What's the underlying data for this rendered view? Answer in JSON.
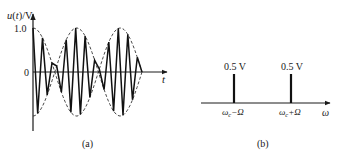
{
  "chart_data": [
    {
      "type": "line",
      "panel": "(a)",
      "title": "",
      "xlabel": "t",
      "ylabel": "u(t)/V",
      "y_ticks": [
        "1.0",
        "0"
      ],
      "ylim": [
        -1.0,
        1.0
      ],
      "series": [
        {
          "name": "DSB signal u(t)",
          "style": "solid",
          "description": "carrier oscillating inside envelope, phase reverses at envelope zeros"
        },
        {
          "name": "envelope ±cos(Ωt)",
          "style": "dashed",
          "peaks": [
            1.0,
            -1.0
          ]
        }
      ],
      "caption": "(a)"
    },
    {
      "type": "bar",
      "panel": "(b)",
      "title": "",
      "xlabel": "ω",
      "categories": [
        "ωc−Ω",
        "ωc+Ω"
      ],
      "values": [
        0.5,
        0.5
      ],
      "value_labels": [
        "0.5 V",
        "0.5 V"
      ],
      "unit": "V",
      "caption": "(b)"
    }
  ],
  "labels": {
    "a": {
      "ylabel_u": "u",
      "ylabel_paren_open": "(",
      "ylabel_t": "t",
      "ylabel_rest": ")/V",
      "tick_one": "1.0",
      "tick_zero": "0",
      "xlabel": "t",
      "caption": "(a)"
    },
    "b": {
      "line1_value": "0.5 V",
      "line2_value": "0.5 V",
      "line1_freq_omega": "ω",
      "line1_freq_sub": "c",
      "line1_freq_rest": "−Ω",
      "line2_freq_omega": "ω",
      "line2_freq_sub": "c",
      "line2_freq_rest": "+Ω",
      "xlabel": "ω",
      "caption": "(b)"
    }
  }
}
